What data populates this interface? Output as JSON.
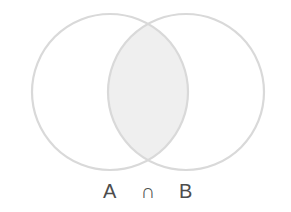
{
  "figure": {
    "kind": "venn-diagram",
    "width": 291,
    "height": 212,
    "background_color": "#ffffff",
    "caption": "A ∩ B",
    "caption_parts": {
      "left_set": "A",
      "operator": "∩",
      "right_set": "B"
    },
    "caption_color": "#4d4d4d",
    "caption_font_size": 20
  },
  "chart_data": {
    "type": "venn",
    "title": "A ∩ B",
    "sets": [
      {
        "name": "A",
        "label": "A",
        "center_x": 110,
        "center_y": 92,
        "radius": 78,
        "stroke_color": "#d9d9d9",
        "fill_color": "#ffffff"
      },
      {
        "name": "B",
        "label": "B",
        "center_x": 186,
        "center_y": 92,
        "radius": 78,
        "stroke_color": "#d9d9d9",
        "fill_color": "#ffffff"
      }
    ],
    "regions": [
      {
        "id": "A-only",
        "label": "",
        "shaded": false,
        "fill_color": "#ffffff"
      },
      {
        "id": "A-intersect-B",
        "label": "A ∩ B",
        "shaded": true,
        "fill_color": "#efefef",
        "highlighted": true
      },
      {
        "id": "B-only",
        "label": "",
        "shaded": false,
        "fill_color": "#ffffff"
      }
    ],
    "operator": "intersection",
    "operator_symbol": "∩",
    "grid": false,
    "legend": "none",
    "axis_labels": {
      "x": "",
      "y": ""
    },
    "annotations": [
      {
        "text": "A ∩ B",
        "x": 148,
        "y": 198,
        "role": "caption"
      }
    ]
  }
}
